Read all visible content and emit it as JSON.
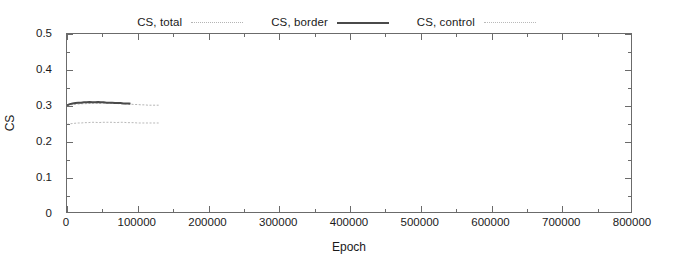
{
  "chart_data": {
    "type": "line",
    "title": "",
    "xlabel": "Epoch",
    "ylabel": "CS",
    "xlim": [
      0,
      800000
    ],
    "ylim": [
      0,
      0.5
    ],
    "grid": false,
    "legend_position": "top-center",
    "xticks": [
      0,
      100000,
      200000,
      300000,
      400000,
      500000,
      600000,
      700000,
      800000
    ],
    "xtick_labels": [
      "0",
      "100000",
      "200000",
      "300000",
      "400000",
      "500000",
      "600000",
      "700000",
      "800000"
    ],
    "yticks": [
      0,
      0.1,
      0.2,
      0.3,
      0.4,
      0.5
    ],
    "ytick_labels": [
      "0",
      "0.1",
      "0.2",
      "0.3",
      "0.4",
      "0.5"
    ],
    "xminor_step": 50000,
    "yminor_step": 0.05,
    "series": [
      {
        "name": "CS, total",
        "style": "dotted",
        "color": "#b4b4b4",
        "width": 1,
        "x": [
          0,
          5000,
          10000,
          15000,
          20000,
          25000,
          30000,
          35000,
          40000,
          45000,
          50000,
          55000,
          60000,
          65000,
          70000,
          75000,
          80000,
          85000,
          90000,
          95000,
          100000,
          105000,
          110000,
          115000,
          120000,
          125000,
          130000
        ],
        "values": [
          0.299,
          0.301,
          0.302,
          0.303,
          0.304,
          0.304,
          0.305,
          0.305,
          0.306,
          0.305,
          0.305,
          0.306,
          0.306,
          0.305,
          0.305,
          0.304,
          0.304,
          0.303,
          0.303,
          0.302,
          0.302,
          0.301,
          0.301,
          0.3,
          0.3,
          0.3,
          0.3
        ]
      },
      {
        "name": "CS, border",
        "style": "solid",
        "color": "#4a4a4a",
        "width": 2,
        "x": [
          0,
          4000,
          8000,
          12000,
          16000,
          20000,
          24000,
          28000,
          32000,
          36000,
          40000,
          44000,
          48000,
          52000,
          56000,
          60000,
          64000,
          68000,
          72000,
          76000,
          80000,
          84000,
          88000,
          90000
        ],
        "values": [
          0.3,
          0.303,
          0.305,
          0.306,
          0.307,
          0.307,
          0.308,
          0.308,
          0.309,
          0.308,
          0.308,
          0.309,
          0.308,
          0.308,
          0.307,
          0.307,
          0.307,
          0.306,
          0.306,
          0.306,
          0.305,
          0.305,
          0.305,
          0.304
        ]
      },
      {
        "name": "CS, control",
        "style": "dotted",
        "color": "#b9b9b9",
        "width": 1,
        "x": [
          0,
          5000,
          10000,
          15000,
          20000,
          25000,
          30000,
          35000,
          40000,
          45000,
          50000,
          55000,
          60000,
          65000,
          70000,
          75000,
          80000,
          85000,
          90000,
          95000,
          100000,
          105000,
          110000,
          115000,
          120000,
          125000,
          130000
        ],
        "values": [
          0.246,
          0.248,
          0.249,
          0.25,
          0.25,
          0.251,
          0.251,
          0.252,
          0.252,
          0.251,
          0.252,
          0.252,
          0.252,
          0.252,
          0.251,
          0.252,
          0.252,
          0.251,
          0.251,
          0.251,
          0.25,
          0.25,
          0.25,
          0.25,
          0.25,
          0.25,
          0.25
        ]
      }
    ]
  },
  "legend": {
    "entries": [
      {
        "label": "CS, total"
      },
      {
        "label": "CS, border"
      },
      {
        "label": "CS, control"
      }
    ]
  },
  "axes": {
    "x_title": "Epoch",
    "y_title": "CS"
  }
}
